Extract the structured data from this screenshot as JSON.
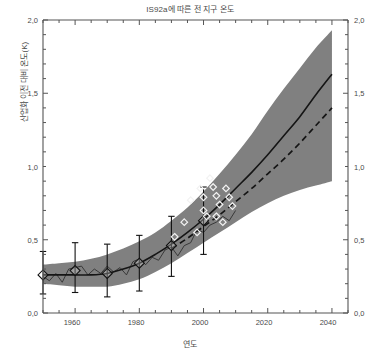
{
  "chart_data": {
    "type": "line",
    "title": "IS92a에 따른 전 지구 온도",
    "xlabel": "연도",
    "ylabel": "산업화 이전 대비 온도(K)",
    "xlim": [
      1950,
      2045
    ],
    "ylim": [
      0.0,
      2.0
    ],
    "grid": false,
    "legend_position": "none",
    "xticks": [
      1960,
      1980,
      2000,
      2020,
      2040
    ],
    "xticklabels": [
      "1960",
      "1980",
      "2000",
      "2020",
      "2040"
    ],
    "xminor_step": 5,
    "yticks": [
      0.0,
      0.5,
      1.0,
      1.5,
      2.0
    ],
    "yticklabels_left": [
      "0,0",
      "0,5",
      "1,0",
      "1,5",
      "2,0"
    ],
    "yticklabels_right": [
      "0,0",
      "0,5",
      "1,0",
      "1,5",
      "2,0"
    ],
    "yminor_step": 0.1,
    "colors": {
      "band_fill": "#808080",
      "central_line": "#151515",
      "dashed_line": "#151515",
      "observed_line": "#303030",
      "marker_edge": "#f2f2f2",
      "axis": "#555555",
      "background": "#ffffff"
    },
    "series": [
      {
        "name": "uncertainty-band-upper",
        "type": "band-edge",
        "x": [
          1950,
          1955,
          1960,
          1965,
          1970,
          1975,
          1980,
          1985,
          1990,
          1995,
          2000,
          2005,
          2010,
          2015,
          2020,
          2025,
          2030,
          2035,
          2040
        ],
        "values": [
          0.33,
          0.34,
          0.35,
          0.37,
          0.4,
          0.44,
          0.49,
          0.55,
          0.63,
          0.72,
          0.83,
          0.95,
          1.08,
          1.22,
          1.38,
          1.53,
          1.67,
          1.81,
          1.93
        ]
      },
      {
        "name": "uncertainty-band-lower",
        "type": "band-edge",
        "x": [
          1950,
          1955,
          1960,
          1965,
          1970,
          1975,
          1980,
          1985,
          1990,
          1995,
          2000,
          2005,
          2010,
          2015,
          2020,
          2025,
          2030,
          2035,
          2040
        ],
        "values": [
          0.2,
          0.19,
          0.18,
          0.18,
          0.18,
          0.2,
          0.23,
          0.28,
          0.34,
          0.41,
          0.48,
          0.55,
          0.62,
          0.69,
          0.75,
          0.8,
          0.84,
          0.87,
          0.9
        ]
      },
      {
        "name": "central-estimate",
        "type": "line",
        "style": "solid",
        "x": [
          1950,
          1955,
          1960,
          1965,
          1970,
          1975,
          1980,
          1985,
          1990,
          1995,
          2000,
          2005,
          2010,
          2015,
          2020,
          2025,
          2030,
          2035,
          2040
        ],
        "values": [
          0.26,
          0.26,
          0.26,
          0.26,
          0.27,
          0.3,
          0.34,
          0.4,
          0.47,
          0.55,
          0.64,
          0.74,
          0.85,
          0.96,
          1.08,
          1.21,
          1.34,
          1.49,
          1.63
        ]
      },
      {
        "name": "alternate-estimate",
        "type": "line",
        "style": "dashed",
        "x": [
          1990,
          1995,
          2000,
          2005,
          2010,
          2015,
          2020,
          2025,
          2030,
          2035,
          2040
        ],
        "values": [
          0.44,
          0.51,
          0.59,
          0.67,
          0.76,
          0.85,
          0.95,
          1.05,
          1.16,
          1.28,
          1.4
        ]
      },
      {
        "name": "observed-temperature",
        "type": "line",
        "style": "thin-wiggly",
        "x": [
          1950,
          1952,
          1954,
          1956,
          1958,
          1960,
          1962,
          1964,
          1966,
          1968,
          1970,
          1972,
          1974,
          1976,
          1978,
          1980,
          1982,
          1984,
          1986,
          1988,
          1990,
          1992,
          1994,
          1996,
          1998,
          2000,
          2002,
          2004,
          2006,
          2008,
          2010
        ],
        "values": [
          0.25,
          0.22,
          0.27,
          0.21,
          0.3,
          0.31,
          0.32,
          0.26,
          0.3,
          0.27,
          0.32,
          0.28,
          0.31,
          0.26,
          0.35,
          0.37,
          0.33,
          0.38,
          0.36,
          0.43,
          0.45,
          0.39,
          0.46,
          0.48,
          0.57,
          0.55,
          0.6,
          0.62,
          0.66,
          0.63,
          0.7
        ]
      }
    ],
    "error_bar_points": [
      {
        "x": 1950,
        "y": 0.26,
        "ylow": 0.13,
        "yhigh": 0.42
      },
      {
        "x": 1960,
        "y": 0.29,
        "ylow": 0.14,
        "yhigh": 0.48
      },
      {
        "x": 1970,
        "y": 0.27,
        "ylow": 0.11,
        "yhigh": 0.47
      },
      {
        "x": 1980,
        "y": 0.34,
        "ylow": 0.15,
        "yhigh": 0.53
      },
      {
        "x": 1990,
        "y": 0.46,
        "ylow": 0.25,
        "yhigh": 0.66
      },
      {
        "x": 2000,
        "y": 0.63,
        "ylow": 0.4,
        "yhigh": 0.86
      }
    ],
    "scatter_markers": {
      "name": "model-scatter-diamonds",
      "points": [
        {
          "x": 1996,
          "y": 0.77
        },
        {
          "x": 1999,
          "y": 0.85
        },
        {
          "x": 2000,
          "y": 0.79
        },
        {
          "x": 2000,
          "y": 0.7
        },
        {
          "x": 1994,
          "y": 0.62
        },
        {
          "x": 1998,
          "y": 0.55
        },
        {
          "x": 2002,
          "y": 0.92
        },
        {
          "x": 2003,
          "y": 0.86
        },
        {
          "x": 2004,
          "y": 0.8
        },
        {
          "x": 2005,
          "y": 0.74
        },
        {
          "x": 2004,
          "y": 0.66
        },
        {
          "x": 2007,
          "y": 0.85
        },
        {
          "x": 2008,
          "y": 0.79
        },
        {
          "x": 2009,
          "y": 0.73
        },
        {
          "x": 2006,
          "y": 0.62
        },
        {
          "x": 1991,
          "y": 0.52
        },
        {
          "x": 2001,
          "y": 0.66
        }
      ]
    }
  }
}
